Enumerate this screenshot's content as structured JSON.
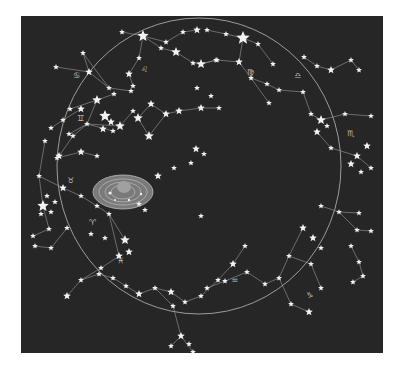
{
  "chart": {
    "title": "",
    "background": "#262626",
    "line_color": "#a8a8a8",
    "star_color": "#f2f2f2",
    "ecliptic": {
      "cx": 178,
      "cy": 150,
      "rx": 142,
      "ry": 148
    },
    "zodiac_glyphs": [
      {
        "symbol": "♋",
        "x": 52,
        "y": 62
      },
      {
        "symbol": "♌",
        "x": 120,
        "y": 56
      },
      {
        "symbol": "♊",
        "x": 56,
        "y": 105
      },
      {
        "symbol": "♍",
        "x": 226,
        "y": 59
      },
      {
        "symbol": "♎",
        "x": 273,
        "y": 62
      },
      {
        "symbol": "♏",
        "x": 326,
        "y": 120
      },
      {
        "symbol": "♉",
        "x": 46,
        "y": 167
      },
      {
        "symbol": "♈",
        "x": 68,
        "y": 209
      },
      {
        "symbol": "♓",
        "x": 96,
        "y": 247
      },
      {
        "symbol": "♒",
        "x": 210,
        "y": 267
      },
      {
        "symbol": "♑",
        "x": 285,
        "y": 282
      }
    ],
    "solar_system": {
      "label": "",
      "cx": 102,
      "cy": 192,
      "rx": 30,
      "ry": 17
    }
  }
}
